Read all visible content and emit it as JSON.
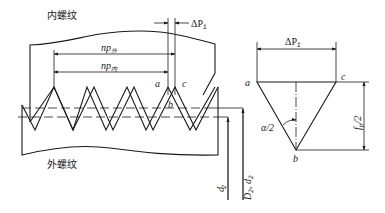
{
  "diagram": {
    "type": "thread-pitch-error-schematic",
    "left_figure": {
      "internal_thread_label": "内螺纹",
      "external_thread_label": "外螺纹",
      "delta_p_label": "ΔP",
      "delta_p_sub": "Σ",
      "np_ext_label": "np",
      "np_ext_sub": "外",
      "np_int_label": "np",
      "np_int_sub": "内",
      "point_a": "a",
      "point_b": "b",
      "point_c": "c",
      "d2_prime_label": "d",
      "d2_prime_sub": "2",
      "d2_prime_sup": "′",
      "pitch_diam_label": "D",
      "pitch_diam_sub1": "2",
      "pitch_diam_sep": ", ",
      "pitch_diam_label2": "d",
      "pitch_diam_sub2": "2"
    },
    "right_figure": {
      "delta_p_label": "ΔP",
      "delta_p_sub": "Σ",
      "point_a": "a",
      "point_b": "b",
      "point_c": "c",
      "angle_label": "α/2",
      "fp_label": "f",
      "fp_sub": "p",
      "fp_suffix": "/2"
    }
  }
}
